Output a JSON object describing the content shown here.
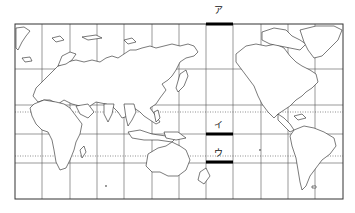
{
  "map": {
    "projection": "equirectangular-style world map centered on Pacific",
    "frame": {
      "left": 15,
      "top": 24,
      "right": 343,
      "bottom": 199
    },
    "meridian_x": [
      42,
      70,
      97,
      124,
      152,
      179,
      206,
      233,
      261,
      288,
      315
    ],
    "parallels_solid_y": [
      69,
      105,
      134,
      163
    ],
    "parallels_dotted_y": [
      112,
      156
    ],
    "markers": [
      {
        "id": "a",
        "label": "ア",
        "bar_x1": 206,
        "bar_x2": 233,
        "bar_y": 24,
        "label_x": 214,
        "label_y": 13
      },
      {
        "id": "i",
        "label": "イ",
        "bar_x1": 206,
        "bar_x2": 233,
        "bar_y": 134,
        "label_x": 214,
        "label_y": 128
      },
      {
        "id": "u",
        "label": "ウ",
        "bar_x1": 206,
        "bar_x2": 233,
        "bar_y": 162,
        "label_x": 214,
        "label_y": 156
      }
    ]
  }
}
